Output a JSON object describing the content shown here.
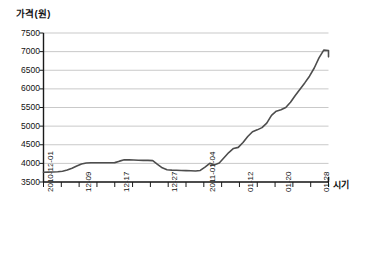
{
  "chart_data": {
    "type": "line",
    "title": "",
    "ylabel": "가격(원)",
    "xlabel": "시기",
    "ylim": [
      3500,
      7500
    ],
    "ytick_values": [
      3500,
      4000,
      4500,
      5000,
      5500,
      6000,
      6500,
      7000,
      7500
    ],
    "ytick_labels": [
      "3500",
      "4000",
      "4500",
      "5000",
      "5500",
      "6000",
      "6500",
      "7000",
      "7500"
    ],
    "grid": true,
    "grid_axis": "y",
    "legend": false,
    "legend_position": "none",
    "line_color": "#4d4d4d",
    "grid_color": "#c9c9c9",
    "axis_color": "#1a1a1a",
    "xtick_labels": [
      "2010-12-01",
      "12-09",
      "12-17",
      "12-27",
      "2011-01-04",
      "01-12",
      "01-20",
      "01-28"
    ],
    "xtick_label_positions": [
      0,
      8,
      16,
      26,
      34,
      42,
      50,
      58
    ],
    "x_minor_tick_count": 16,
    "x_range_days": [
      0,
      60
    ],
    "x": [
      0,
      1,
      2,
      3,
      4,
      5,
      6,
      7,
      8,
      9,
      10,
      11,
      12,
      13,
      14,
      15,
      16,
      17,
      18,
      19,
      20,
      21,
      22,
      23,
      24,
      25,
      26,
      27,
      28,
      29,
      30,
      31,
      32,
      33,
      34,
      35,
      36,
      37,
      38,
      39,
      40,
      41,
      42,
      43,
      44,
      45,
      46,
      47,
      48,
      49,
      50,
      51,
      52,
      53,
      54,
      55,
      56,
      57,
      58,
      59,
      60
    ],
    "values": [
      3760,
      3765,
      3770,
      3775,
      3790,
      3820,
      3870,
      3930,
      3985,
      4010,
      4015,
      4015,
      4015,
      4015,
      4015,
      4020,
      4060,
      4095,
      4095,
      4090,
      4085,
      4080,
      4080,
      4075,
      3975,
      3880,
      3830,
      3820,
      3815,
      3810,
      3805,
      3800,
      3795,
      3810,
      3900,
      4000,
      3960,
      4010,
      4150,
      4290,
      4400,
      4430,
      4560,
      4720,
      4850,
      4900,
      4960,
      5080,
      5290,
      5400,
      5440,
      5500,
      5640,
      5820,
      5990,
      6160,
      6340,
      6560,
      6830,
      7040,
      7030
    ],
    "series_name": "가격",
    "units": "원",
    "peak_value": 7040,
    "min_value": 3760,
    "end_value": 6860
  },
  "axes": {
    "y_axis_title": "가격(원)",
    "x_axis_title": "시기"
  }
}
